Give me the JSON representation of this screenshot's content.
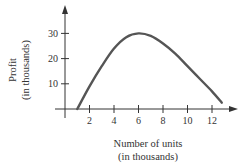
{
  "chart_data": {
    "type": "line",
    "title": "",
    "xlabel": "Number of units",
    "xlabel_sub": "(in thousands)",
    "ylabel": "Profit",
    "ylabel_sub": "(in thousands)",
    "xlim": [
      0,
      14
    ],
    "ylim": [
      0,
      35
    ],
    "x_ticks": [
      2,
      4,
      6,
      8,
      10,
      12
    ],
    "y_ticks": [
      10,
      20,
      30
    ],
    "grid": false,
    "legend": null,
    "series": [
      {
        "name": "Profit",
        "x": [
          1,
          2,
          3,
          4,
          5,
          6,
          7,
          8,
          9,
          10,
          11,
          12,
          12.8
        ],
        "y": [
          0,
          9,
          17,
          24,
          28.5,
          30,
          29,
          26,
          22,
          17,
          12,
          7,
          2.5
        ]
      }
    ],
    "colors": {
      "curve": "#555555",
      "axis": "#333333"
    }
  }
}
